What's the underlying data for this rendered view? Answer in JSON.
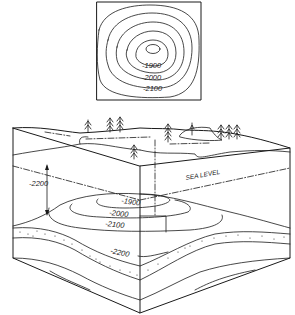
{
  "diagram": {
    "type": "structure-contour-map-with-block-diagram",
    "map_view": {
      "contour_labels": [
        "-1900",
        "-2000",
        "-2100"
      ],
      "contour_count": 5
    },
    "block_diagram": {
      "sea_level_label": "SEA LEVEL",
      "depth_label": "-2200",
      "structure_contour_labels": [
        "-1900",
        "-2000",
        "-2100",
        "-2200"
      ]
    },
    "colors": {
      "ink": "#1a1a1a",
      "paper": "#ffffff"
    }
  }
}
